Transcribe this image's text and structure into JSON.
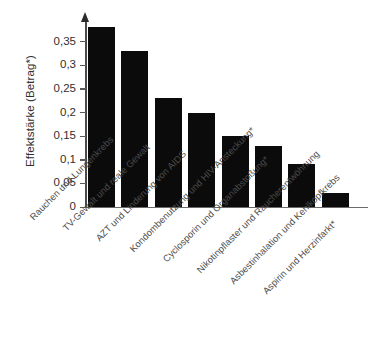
{
  "chart_data": {
    "type": "bar",
    "title": "",
    "subtitle": "",
    "xlabel": "",
    "ylabel": "Effektstärke (Betrag*)",
    "ylim": [
      0,
      0.4
    ],
    "grid": false,
    "legend": null,
    "bar_color": "#0b0b0b",
    "axis_color": "#4a4a4a",
    "y_ticks": [
      "0",
      "0,05",
      "0,1",
      "0,15",
      "0,2",
      "0,25",
      "0,3",
      "0,35"
    ],
    "y_tick_values": [
      0,
      0.05,
      0.1,
      0.15,
      0.2,
      0.25,
      0.3,
      0.35
    ],
    "categories": [
      "Rauchen und Lungenkrebs",
      "TV-Gewalt und reale Gewalt",
      "AZT und Linderung von AIDS",
      "Kondombenutzung und HIV-Ansteckung*",
      "Cyclosporin und Organabstoßung*",
      "Nikotinpflaster und Raucherentwöhnung",
      "Asbestinhalation und Kehlkopfkrebs",
      "Aspirin und Herzinfarkt*"
    ],
    "values": [
      0.38,
      0.33,
      0.23,
      0.2,
      0.15,
      0.13,
      0.09,
      0.03
    ]
  }
}
